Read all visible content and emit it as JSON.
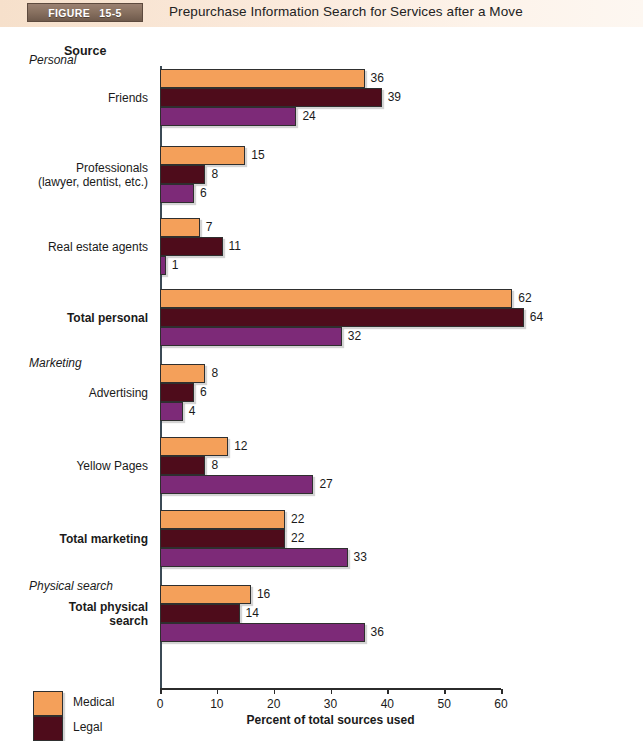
{
  "header": {
    "tag_word": "FIGURE",
    "tag_number": "15-5",
    "title": "Prepurchase Information Search for Services after a Move",
    "tag_bg": "#87705f",
    "bar_bg": "#f7e3d1"
  },
  "chart_data": {
    "type": "bar",
    "orientation": "horizontal",
    "title": "Prepurchase Information Search for Services after a Move",
    "xlabel": "Percent of total sources used",
    "ylabel": "Source",
    "xlim": [
      0,
      60
    ],
    "xticks": [
      0,
      10,
      20,
      30,
      40,
      50,
      60
    ],
    "grid": false,
    "legend_position": "bottom-left",
    "categories": [
      "Friends",
      "Professionals (lawyer, dentist, etc.)",
      "Real estate agents",
      "Total personal",
      "Advertising",
      "Yellow Pages",
      "Total marketing",
      "Total physical search"
    ],
    "series": [
      {
        "name": "Medical",
        "color": "#F4A05A",
        "values": [
          36,
          15,
          7,
          62,
          8,
          12,
          22,
          16
        ]
      },
      {
        "name": "Legal",
        "color": "#4E0C1B",
        "values": [
          39,
          8,
          11,
          64,
          6,
          8,
          22,
          14
        ]
      },
      {
        "name": "Veterinary",
        "color": "#7D2A78",
        "values": [
          24,
          6,
          1,
          32,
          4,
          27,
          33,
          36
        ]
      }
    ],
    "section_headers": [
      "Personal",
      "Marketing",
      "Physical search"
    ]
  },
  "axis": {
    "y_header": "Source",
    "x_title": "Percent of total sources used",
    "tick_labels": [
      "0",
      "10",
      "20",
      "30",
      "40",
      "50",
      "60"
    ]
  },
  "sections": [
    {
      "label": "Personal"
    },
    {
      "label": "Marketing"
    },
    {
      "label": "Physical search"
    }
  ],
  "groups": [
    {
      "label_line1": "Friends",
      "label_line2": "",
      "bold": false,
      "values": [
        36,
        39,
        24
      ]
    },
    {
      "label_line1": "Professionals",
      "label_line2": "(lawyer, dentist, etc.)",
      "bold": false,
      "values": [
        15,
        8,
        6
      ]
    },
    {
      "label_line1": "Real estate agents",
      "label_line2": "",
      "bold": false,
      "values": [
        7,
        11,
        1
      ]
    },
    {
      "label_line1": "Total personal",
      "label_line2": "",
      "bold": true,
      "values": [
        62,
        64,
        32
      ]
    },
    {
      "label_line1": "Advertising",
      "label_line2": "",
      "bold": false,
      "values": [
        8,
        6,
        4
      ]
    },
    {
      "label_line1": "Yellow Pages",
      "label_line2": "",
      "bold": false,
      "values": [
        12,
        8,
        27
      ]
    },
    {
      "label_line1": "Total marketing",
      "label_line2": "",
      "bold": true,
      "values": [
        22,
        22,
        33
      ]
    },
    {
      "label_line1": "Total physical",
      "label_line2": "search",
      "bold": true,
      "values": [
        16,
        14,
        36
      ]
    }
  ],
  "legend": {
    "items": [
      {
        "label": "Medical",
        "color": "#F4A05A"
      },
      {
        "label": "Legal",
        "color": "#4E0C1B"
      },
      {
        "label": "Veterinary",
        "color": "#7D2A78"
      }
    ]
  }
}
